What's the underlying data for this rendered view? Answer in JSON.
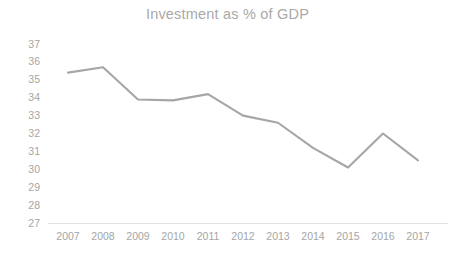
{
  "chart_data": {
    "type": "line",
    "title": "Investment as % of GDP",
    "xlabel": "",
    "ylabel": "",
    "categories": [
      "2007",
      "2008",
      "2009",
      "2010",
      "2011",
      "2012",
      "2013",
      "2014",
      "2015",
      "2016",
      "2017"
    ],
    "values": [
      35.4,
      35.7,
      33.9,
      33.85,
      34.2,
      33.0,
      32.6,
      31.2,
      30.1,
      32.0,
      30.5
    ],
    "series": [
      {
        "name": "Investment as % of GDP",
        "values": [
          35.4,
          35.7,
          33.9,
          33.85,
          34.2,
          33.0,
          32.6,
          31.2,
          30.1,
          32.0,
          30.5
        ]
      }
    ],
    "ylim": [
      27,
      37
    ],
    "ytick_step": 1,
    "ytick_labels": [
      "37",
      "36",
      "35",
      "34",
      "33",
      "32",
      "31",
      "30",
      "29",
      "28",
      "27"
    ],
    "xtick_labels": [
      "2007",
      "2008",
      "2009",
      "2010",
      "2011",
      "2012",
      "2013",
      "2014",
      "2015",
      "2016",
      "2017"
    ],
    "grid": false,
    "legend": false,
    "legend_position": "none",
    "line_color": "#a6a6a6",
    "title_color": "#a9a9a9",
    "tick_color": "#a5a5a5",
    "background_color": "#ffffff"
  }
}
